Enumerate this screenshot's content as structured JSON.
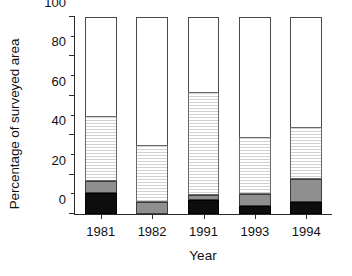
{
  "chart_data": {
    "type": "bar",
    "subtype": "stacked",
    "title": "",
    "xlabel": "Year",
    "ylabel": "Percentage of surveyed area",
    "categories": [
      "1981",
      "1982",
      "1991",
      "1993",
      "1994"
    ],
    "ylim": [
      0,
      100
    ],
    "ytick_labels": [
      "0",
      "20",
      "40",
      "60",
      "80",
      "100"
    ],
    "ytick_values": [
      0,
      20,
      40,
      60,
      80,
      100
    ],
    "yminor_tick_values": [
      10,
      30,
      50,
      70,
      90
    ],
    "grid": false,
    "legend": "none",
    "series": [
      {
        "name": "black",
        "fill": "solid-black",
        "color": "#0d0d0d",
        "values": [
          10.5,
          0,
          7,
          4,
          6
        ]
      },
      {
        "name": "gray",
        "fill": "solid-gray",
        "color": "#8f8f8f",
        "values": [
          6.5,
          6,
          2.5,
          6,
          12
        ]
      },
      {
        "name": "dotted",
        "fill": "horizontal-hatch",
        "color": "#fbfbfb",
        "values": [
          33,
          29,
          52.5,
          29,
          26
        ]
      }
    ],
    "cumulative_tops": [
      50,
      35,
      62,
      39,
      44
    ],
    "bar_totals": [
      50,
      35,
      62,
      39,
      44
    ],
    "remainder_name": "white",
    "remainder_color": "#ffffff",
    "remainder_values": [
      50,
      65,
      38,
      61,
      56
    ]
  }
}
